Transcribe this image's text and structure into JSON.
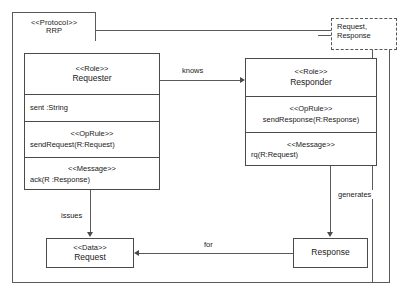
{
  "diagram": {
    "protocol": {
      "stereotype": "<<Protocol>>",
      "name": "RRP"
    },
    "parameter_note": {
      "line1": "Request,",
      "line2": "Response"
    },
    "roles": [
      {
        "id": "requester",
        "stereotype": "<<Role>>",
        "name": "Requester",
        "attribute": "sent :String",
        "oprule_stereotype": "<<OpRule>>",
        "oprule": "sendRequest(R:Request)",
        "message_stereotype": "<<Message>>",
        "message": "ack(R :Response)"
      },
      {
        "id": "responder",
        "stereotype": "<<Role>>",
        "name": "Responder",
        "oprule_stereotype": "<<OpRule>>",
        "oprule": "sendResponse(R:Response)",
        "message_stereotype": "<<Message>>",
        "message": "rq(R:Request)"
      }
    ],
    "data_types": [
      {
        "id": "request",
        "stereotype": "<<Data>>",
        "name": "Request"
      },
      {
        "id": "response",
        "stereotype": "<<Data>>",
        "name": "Response"
      }
    ],
    "associations": [
      {
        "id": "knows",
        "label": "knows",
        "from": "Requester",
        "to": "Responder"
      },
      {
        "id": "issues",
        "label": "issues",
        "from": "Requester",
        "to": "Request"
      },
      {
        "id": "generates",
        "label": "generates",
        "from": "Responder",
        "to": "Response"
      },
      {
        "id": "for",
        "label": "for",
        "from": "Response",
        "to": "Request"
      }
    ],
    "colors": {
      "stroke": "#4a4a4a",
      "frame_stroke": "#5a5a5a",
      "background": "#ffffff",
      "text": "#1a1a1a"
    }
  }
}
